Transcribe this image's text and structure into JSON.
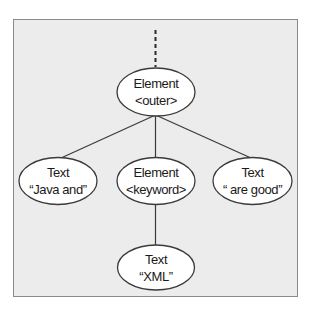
{
  "diagram": {
    "type": "tree",
    "colors": {
      "page_background": "#ffffff",
      "frame_background": "#ececec",
      "frame_border": "#8a8a8a",
      "node_fill": "#ffffff",
      "node_stroke": "#3a3a3a",
      "text": "#1a1a1a"
    },
    "nodes": [
      {
        "id": "outer",
        "kind": "Element",
        "line1": "Element",
        "line2": "<outer>"
      },
      {
        "id": "java-and",
        "kind": "Text",
        "line1": "Text",
        "line2": "“Java and”"
      },
      {
        "id": "keyword",
        "kind": "Element",
        "line1": "Element",
        "line2": "<keyword>"
      },
      {
        "id": "are-good",
        "kind": "Text",
        "line1": "Text",
        "line2": "“ are good”"
      },
      {
        "id": "xml",
        "kind": "Text",
        "line1": "Text",
        "line2": "“XML”"
      }
    ],
    "edges": [
      {
        "from": "(parent)",
        "to": "outer",
        "style": "dashed"
      },
      {
        "from": "outer",
        "to": "java-and",
        "style": "solid"
      },
      {
        "from": "outer",
        "to": "keyword",
        "style": "solid"
      },
      {
        "from": "outer",
        "to": "are-good",
        "style": "solid"
      },
      {
        "from": "keyword",
        "to": "xml",
        "style": "solid"
      }
    ]
  }
}
